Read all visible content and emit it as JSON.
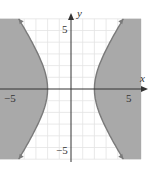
{
  "chart_data": {
    "type": "area",
    "title": "",
    "relation": "x^2/4 - y^2/9 >= 1",
    "boundary": {
      "a": 2,
      "b": 3,
      "style": "solid"
    },
    "xlabel": "x",
    "ylabel": "y",
    "xlim": [
      -6,
      6
    ],
    "ylim": [
      -6,
      6
    ],
    "x_ticks_labeled": [
      -5,
      5
    ],
    "y_ticks_labeled": [
      5,
      -5
    ],
    "grid": true,
    "grid_step": 1,
    "colors": {
      "shade": "#a9a9a9",
      "curve": "#7a7a7a",
      "grid": "#e3e3e3",
      "axis": "#333333"
    }
  },
  "labels": {
    "x_axis": "x",
    "y_axis": "y",
    "x_neg5": "−5",
    "x_pos5": "5",
    "y_pos5": "5",
    "y_neg5": "−5"
  }
}
